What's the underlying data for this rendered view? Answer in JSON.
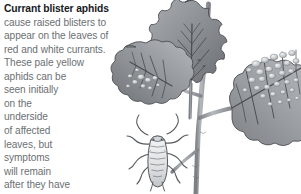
{
  "figure": {
    "kind": "botanical-pest-illustration",
    "background_color": "#ffffff",
    "palette": {
      "leaf_mid": "#8d9094",
      "leaf_dark": "#5e6266",
      "leaf_light": "#c3c6c9",
      "vein": "#4a4e52",
      "blister_highlight": "#e2e4e6",
      "stem": "#9da0a4",
      "aphid_body": "#e8eaec",
      "aphid_outline": "#55595d",
      "outline": "#3f4347"
    }
  },
  "caption": {
    "title": "Currant blister aphids",
    "title_color": "#16191c",
    "body_color": "#6b6f73",
    "lines": [
      "cause raised blisters to",
      "appear on the leaves of",
      "red and white currants.",
      "These pale yellow",
      "aphids can be",
      "seen initially",
      "on the",
      "underside",
      "of affected",
      "leaves, but",
      "symptoms",
      "will remain",
      "after they have",
      "moved on."
    ]
  },
  "illustration_parts": [
    {
      "name": "upright-center-leaf",
      "description": "serrated lobed currant leaf pointing up"
    },
    {
      "name": "left-leaf",
      "description": "lobed leaf at mid-left with blisters"
    },
    {
      "name": "right-blistered-leaf",
      "description": "large leaf covered in raised pale blisters"
    },
    {
      "name": "stem",
      "description": "branching woody stem"
    },
    {
      "name": "aphid",
      "description": "magnified pale segmented aphid with antennae and six legs"
    }
  ]
}
